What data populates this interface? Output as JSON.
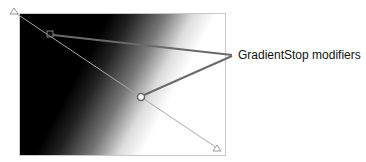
{
  "diagram": {
    "callout_label": "GradientStop modifiers",
    "gradient": {
      "type": "linear",
      "start_color": "#000000",
      "end_color": "#ffffff",
      "start_handle": [
        14,
        12
      ],
      "end_handle": [
        217,
        148
      ]
    },
    "stops": [
      {
        "name": "stop-1",
        "position": [
          50,
          34
        ],
        "shape": "square"
      },
      {
        "name": "stop-2",
        "position": [
          141,
          97
        ],
        "shape": "circle"
      }
    ],
    "colors": {
      "gradient_line": "#9a9a9a",
      "callout_line": "#6a6a6a",
      "border": "#c8c8c8"
    }
  }
}
